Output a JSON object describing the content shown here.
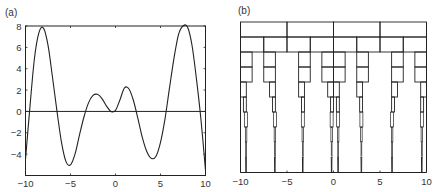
{
  "chart_data": [
    {
      "type": "line",
      "panel_label": "(a)",
      "title": "",
      "xlabel": "",
      "ylabel": "",
      "xlim": [
        -10,
        10
      ],
      "ylim": [
        -6,
        8
      ],
      "xticks": [
        -10,
        -5,
        0,
        5,
        10
      ],
      "yticks": [
        8,
        6,
        4,
        2,
        0,
        -2,
        -4
      ],
      "grid": false,
      "series": [
        {
          "name": "f(x)",
          "x": [
            -10,
            -9.5,
            -9,
            -8.5,
            -8,
            -7.5,
            -7,
            -6.5,
            -6,
            -5.5,
            -5,
            -4.5,
            -4,
            -3.5,
            -3,
            -2.5,
            -2,
            -1.5,
            -1,
            -0.5,
            0,
            0.5,
            1,
            1.5,
            2,
            2.5,
            3,
            3.5,
            4,
            4.5,
            5,
            5.5,
            6,
            6.5,
            7,
            7.5,
            8,
            8.5,
            9,
            9.5,
            10
          ],
          "y": [
            -4.5,
            0.5,
            5.0,
            7.4,
            7.8,
            6.2,
            3.2,
            0.0,
            -2.9,
            -4.7,
            -5.0,
            -4.0,
            -2.2,
            -0.5,
            0.8,
            1.5,
            1.6,
            1.2,
            0.5,
            0.0,
            0.1,
            1.1,
            2.2,
            2.1,
            1.0,
            -0.7,
            -2.5,
            -3.8,
            -4.4,
            -4.2,
            -2.9,
            -0.7,
            2.2,
            5.0,
            7.2,
            8.1,
            7.9,
            6.2,
            3.0,
            -0.8,
            -5.5
          ]
        },
        {
          "name": "zero line",
          "x": [
            -10,
            10
          ],
          "y": [
            0,
            0
          ]
        }
      ]
    },
    {
      "type": "diagram",
      "panel_label": "(b)",
      "description": "Nested interval subdivision boxes converging to the zeros of f(x)",
      "xlim": [
        -10,
        10
      ],
      "xticks": [
        -10,
        -5,
        0,
        5,
        10
      ],
      "rows": [
        {
          "level": 1,
          "intervals": [
            [
              -10,
              -5
            ],
            [
              -5,
              0
            ],
            [
              0,
              5
            ],
            [
              5,
              10
            ]
          ]
        },
        {
          "level": 2,
          "intervals": [
            [
              -10,
              -7.5
            ],
            [
              -7.5,
              -5
            ],
            [
              -5,
              -2.5
            ],
            [
              -2.5,
              0
            ],
            [
              0,
              2.5
            ],
            [
              2.5,
              5
            ],
            [
              5,
              7.5
            ],
            [
              7.5,
              10
            ]
          ]
        },
        {
          "level": 3,
          "intervals": [
            [
              -10,
              -8.75
            ],
            [
              -7.5,
              -6.25
            ],
            [
              -3.75,
              -2.5
            ],
            [
              -1.25,
              0
            ],
            [
              0,
              1.25
            ],
            [
              2.5,
              3.75
            ],
            [
              6.25,
              7.5
            ],
            [
              8.75,
              10
            ]
          ]
        },
        {
          "level": 4,
          "intervals": [
            [
              -10,
              -8.75
            ],
            [
              -7.5,
              -6.25
            ],
            [
              -3.75,
              -2.5
            ],
            [
              -1.25,
              0
            ],
            [
              0,
              1.25
            ],
            [
              2.5,
              3.75
            ],
            [
              6.25,
              7.5
            ],
            [
              8.75,
              10
            ]
          ]
        },
        {
          "level": 5,
          "intervals": [
            [
              -10,
              -9.375
            ],
            [
              -6.875,
              -6.25
            ],
            [
              -3.75,
              -3.125
            ],
            [
              -0.625,
              0
            ],
            [
              0,
              0.625
            ],
            [
              2.5,
              3.125
            ],
            [
              6.25,
              6.875
            ],
            [
              9.375,
              10
            ]
          ]
        },
        {
          "level": 6,
          "intervals": [
            [
              -9.6875,
              -9.375
            ],
            [
              -6.5625,
              -6.25
            ],
            [
              -3.4375,
              -3.125
            ],
            [
              -0.3125,
              0
            ],
            [
              0.3125,
              0.625
            ],
            [
              2.8125,
              3.125
            ],
            [
              6.25,
              6.5625
            ],
            [
              9.375,
              9.6875
            ]
          ]
        }
      ],
      "roots": [
        -9.4,
        -6.3,
        -3.3,
        -0.2,
        0.5,
        3.0,
        6.3,
        9.5
      ]
    }
  ],
  "labels": {
    "panel_a": "(a)",
    "panel_b": "(b)"
  }
}
